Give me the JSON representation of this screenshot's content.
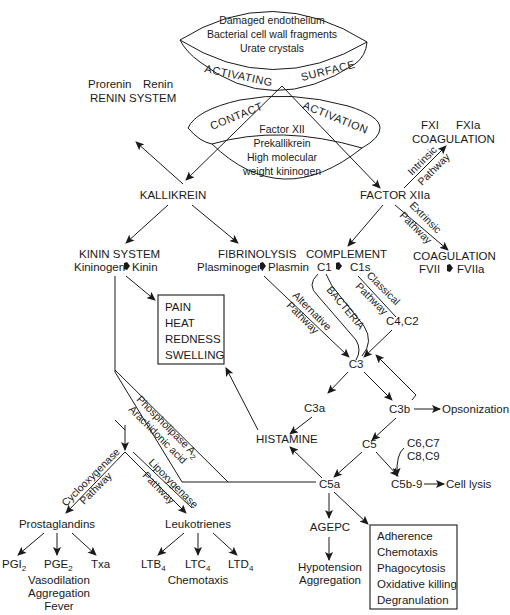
{
  "diagram": {
    "activating_surface": {
      "items": [
        "Damaged endothelium",
        "Bacterial cell wall fragments",
        "Urate crystals"
      ],
      "band_left": "ACTIVATING",
      "band_right": "SURFACE"
    },
    "contact_activation": {
      "band_left": "CONTACT",
      "band_right": "ACTIVATION",
      "items": [
        "Factor XII",
        "Prekallikrein",
        "High molecular",
        "weight kininogen"
      ]
    },
    "renin": {
      "from": "Prorenin",
      "to": "Renin",
      "title": "RENIN SYSTEM"
    },
    "kallikrein": "KALLIKREIN",
    "factor_xiia": "FACTOR XIIa",
    "coag_intrinsic": {
      "from": "FXI",
      "to": "FXIa",
      "title": "COAGULATION",
      "path_l1": "Intrinsic",
      "path_l2": "Pathway"
    },
    "coag_extrinsic": {
      "title": "COAGULATION",
      "from": "FVII",
      "to": "FVIIa",
      "path_l1": "Extrinsic",
      "path_l2": "Pathway"
    },
    "kinin": {
      "title": "KININ SYSTEM",
      "from": "Kininogen",
      "to": "Kinin"
    },
    "fibrinolysis": {
      "title": "FIBRINOLYSIS",
      "from": "Plasminogen",
      "to": "Plasmin"
    },
    "complement": {
      "title": "COMPLEMENT",
      "from": "C1",
      "to": "C1s"
    },
    "classical": {
      "l1": "Classical",
      "l2": "Pathway",
      "target": "C4,C2"
    },
    "alternative": {
      "l1": "Alternative",
      "l2": "Pathway"
    },
    "bacteria": "BACTERIA",
    "symptoms_box": [
      "PAIN",
      "HEAT",
      "REDNESS",
      "SWELLING"
    ],
    "c3": "C3",
    "c3a": "C3a",
    "c3b": "C3b",
    "opsonization": "Opsonization",
    "histamine": "HISTAMINE",
    "c5": "C5",
    "c6_9": {
      "l1": "C6,C7",
      "l2": "C8,C9"
    },
    "c5b9": "C5b-9",
    "cell_lysis": "Cell lysis",
    "c5a": "C5a",
    "phospholipase": {
      "l1": "Phospholipase A",
      "sub": "2",
      "l2": "Arachidonic acid"
    },
    "cyclooxygenase": {
      "l1": "Cyclooxygenase",
      "l2": "Pathway"
    },
    "lipoxygenase": {
      "l1": "Lipoxygenase",
      "l2": "Pathway"
    },
    "prostaglandins": {
      "title": "Prostaglandins",
      "children": [
        {
          "base": "PGI",
          "sub": "2"
        },
        {
          "base": "PGE",
          "sub": "2"
        },
        {
          "base": "Txa",
          "sub": ""
        }
      ],
      "effects": [
        "Vasodilation",
        "Aggregation",
        "Fever"
      ]
    },
    "leukotrienes": {
      "title": "Leukotrienes",
      "children": [
        {
          "base": "LTB",
          "sub": "4"
        },
        {
          "base": "LTC",
          "sub": "4"
        },
        {
          "base": "LTD",
          "sub": "4"
        }
      ],
      "effects": [
        "Chemotaxis"
      ]
    },
    "agepc": "AGEPC",
    "agepc_effects": [
      "Hypotension",
      "Aggregation"
    ],
    "c5a_box": [
      "Adherence",
      "Chemotaxis",
      "Phagocytosis",
      "Oxidative killing",
      "Degranulation"
    ]
  }
}
